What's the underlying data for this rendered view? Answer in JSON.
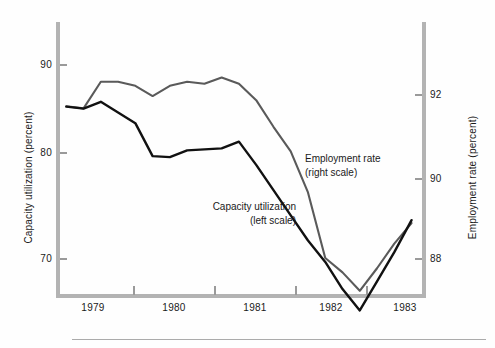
{
  "chart_data": {
    "type": "line",
    "title": "",
    "subtitle": "",
    "xlabel": "",
    "grid": false,
    "legend_position": "inline-annotations",
    "x_axis": {
      "tick_labels": [
        "1979",
        "1980",
        "1981",
        "1982",
        "1983"
      ],
      "boundary_ticks": [
        1979.0,
        1980.0,
        1981.0,
        1982.0,
        1983.0
      ],
      "range": [
        1978.5,
        1983.8
      ]
    },
    "left_axis": {
      "label": "Capacity utilization (percent)",
      "tick_labels": [
        "90",
        "80",
        "70"
      ],
      "ticks": [
        90,
        80,
        70
      ],
      "range": [
        63.5,
        92.0
      ]
    },
    "right_axis": {
      "label": "Employment rate (percent)",
      "tick_labels": [
        "92",
        "90",
        "88"
      ],
      "ticks": [
        92,
        90,
        88
      ],
      "range": [
        86.3,
        93.0
      ]
    },
    "series": [
      {
        "name": "Capacity utilization",
        "annotation": "Capacity utilization",
        "annotation_sub": "(left scale)",
        "scale": "left",
        "color": "#111111",
        "x": [
          1978.62,
          1978.87,
          1979.12,
          1979.37,
          1979.62,
          1979.87,
          1980.12,
          1980.37,
          1980.62,
          1980.87,
          1981.12,
          1981.37,
          1981.62,
          1981.87,
          1982.12,
          1982.37,
          1982.62,
          1982.87,
          1983.12,
          1983.37,
          1983.62
        ],
        "values": [
          85.6,
          85.4,
          86.1,
          85.0,
          83.9,
          80.5,
          80.4,
          81.1,
          81.2,
          81.3,
          82.0,
          79.6,
          77.0,
          74.4,
          71.8,
          69.6,
          66.8,
          64.6,
          67.6,
          70.6,
          73.9
        ]
      },
      {
        "name": "Employment rate",
        "annotation": "Employment rate",
        "annotation_sub": "(right scale)",
        "scale": "right",
        "color": "#5a5a5a",
        "x": [
          1978.62,
          1978.87,
          1979.12,
          1979.37,
          1979.62,
          1979.87,
          1980.12,
          1980.37,
          1980.62,
          1980.87,
          1981.12,
          1981.37,
          1981.62,
          1981.87,
          1982.12,
          1982.37,
          1982.62,
          1982.87,
          1983.12,
          1983.37,
          1983.62
        ],
        "values": [
          91.7,
          91.65,
          92.3,
          92.3,
          92.2,
          91.95,
          92.2,
          92.3,
          92.25,
          92.4,
          92.25,
          91.85,
          91.2,
          90.6,
          89.6,
          88.0,
          87.65,
          87.2,
          87.75,
          88.35,
          88.85
        ]
      }
    ]
  },
  "colors": {
    "axis": "#b3b3b3",
    "tick": "#9a9a9a",
    "text": "#1a1a1a",
    "series_capacity": "#111111",
    "series_employment": "#5a5a5a",
    "background": "#fefefe"
  }
}
